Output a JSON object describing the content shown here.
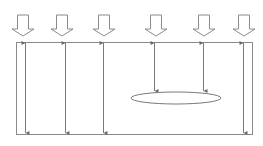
{
  "diagram": {
    "title": "",
    "colors": {
      "stroke": "#8a8a8a",
      "block_arrow_fill": "#ffffff",
      "background": "#ffffff"
    },
    "box": {
      "x": 16,
      "y": 42,
      "width": 236,
      "height": 92
    },
    "block_arrows": [
      {
        "id": "load-1",
        "cx": 23
      },
      {
        "id": "load-2",
        "cx": 62
      },
      {
        "id": "load-3",
        "cx": 104
      },
      {
        "id": "load-4",
        "cx": 156
      },
      {
        "id": "load-5",
        "cx": 204
      },
      {
        "id": "load-6",
        "cx": 244
      }
    ],
    "block_arrow_geometry": {
      "top": 15,
      "shaft_half_width": 5.5,
      "head_half_width": 11,
      "head_start": 29,
      "tip": 36
    },
    "inner_arrows": [
      {
        "id": "span-1",
        "x": 25,
        "y1": 43,
        "y2": 133,
        "double": true
      },
      {
        "id": "span-2",
        "x": 65,
        "y1": 43,
        "y2": 133,
        "double": true
      },
      {
        "id": "span-3",
        "x": 103,
        "y1": 43,
        "y2": 133,
        "double": true
      },
      {
        "id": "span-4",
        "x": 154,
        "y1": 43,
        "y2": 91,
        "double": true
      },
      {
        "id": "span-5",
        "x": 203,
        "y1": 43,
        "y2": 91,
        "double": true
      },
      {
        "id": "span-6",
        "x": 243,
        "y1": 43,
        "y2": 133,
        "double": true
      }
    ],
    "ellipse": {
      "cx": 176,
      "cy": 98,
      "rx": 45,
      "ry": 6
    }
  }
}
